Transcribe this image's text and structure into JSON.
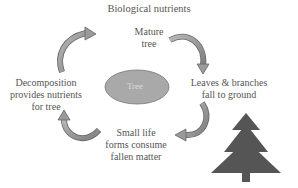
{
  "title": "Biological nutrients",
  "center": {
    "label": "Tree",
    "fill": "#a9a9a9"
  },
  "nodes": {
    "top": [
      "Mature",
      "tree"
    ],
    "right": [
      "Leaves & branches",
      "fall to ground"
    ],
    "bottom": [
      "Small life",
      "forms consume",
      "fallen matter"
    ],
    "left": [
      "Decomposition",
      "provides nutrients",
      "for tree"
    ]
  },
  "colors": {
    "arrow": "#9a9a9a",
    "arrow_stroke": "#555555",
    "tree_icon": "#555555"
  }
}
